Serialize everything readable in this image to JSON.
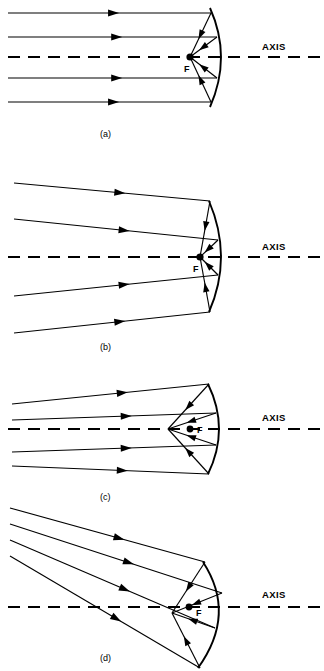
{
  "figure": {
    "panels": [
      {
        "id": "a",
        "caption": "(a)",
        "caption_x": 100,
        "caption_y": 137,
        "axis_label": "AXIS",
        "axis_label_x": 262,
        "axis_label_y": 50,
        "axis_y": 57,
        "axis_x_start": 8,
        "axis_x_end": 324,
        "focus_label": "F",
        "focus_label_x": 184,
        "focus_label_y": 72,
        "focus_x": 190,
        "focus_y": 57,
        "focus_r": 3.6,
        "vertex_x": 190,
        "vertex_y": 57,
        "arc": "M 210 8 Q 232 57 210 107",
        "rays": [
          {
            "d": "M 8 13 L 211 13",
            "arrow_at": 0.52
          },
          {
            "d": "M 8 37 L 217 37",
            "arrow_at": 0.52
          },
          {
            "d": "M 8 78 L 217 78",
            "arrow_at": 0.52
          },
          {
            "d": "M 8 102 L 211 102",
            "arrow_at": 0.52
          }
        ],
        "reflected": [
          {
            "d": "M 211 13 L 190 57",
            "arrow_at": 0.5
          },
          {
            "d": "M 217 37 L 190 57",
            "arrow_at": 0.52
          },
          {
            "d": "M 217 78 L 190 57",
            "arrow_at": 0.52
          },
          {
            "d": "M 211 102 L 190 57",
            "arrow_at": 0.5
          }
        ]
      },
      {
        "id": "b",
        "caption": "(b)",
        "caption_x": 100,
        "caption_y": 350,
        "axis_label": "AXIS",
        "axis_label_x": 262,
        "axis_label_y": 250,
        "axis_y": 257,
        "axis_x_start": 8,
        "axis_x_end": 324,
        "focus_label": "F",
        "focus_label_x": 193,
        "focus_label_y": 272,
        "focus_x": 200,
        "focus_y": 257,
        "focus_r": 3.6,
        "vertex_x": 200,
        "vertex_y": 257,
        "arc": "M 209 201 Q 233 257 209 312",
        "rays": [
          {
            "d": "M 14 183 L 210 201",
            "arrow_at": 0.54
          },
          {
            "d": "M 14 219 L 218 240",
            "arrow_at": 0.54
          },
          {
            "d": "M 14 296 L 218 275",
            "arrow_at": 0.54
          },
          {
            "d": "M 14 333 L 210 312",
            "arrow_at": 0.54
          }
        ],
        "reflected": [
          {
            "d": "M 210 201 L 200 257",
            "arrow_at": 0.45
          },
          {
            "d": "M 218 240 L 200 257",
            "arrow_at": 0.55
          },
          {
            "d": "M 218 275 L 200 257",
            "arrow_at": 0.55
          },
          {
            "d": "M 210 312 L 200 257",
            "arrow_at": 0.45
          }
        ]
      },
      {
        "id": "c",
        "caption": "(c)",
        "caption_x": 100,
        "caption_y": 500,
        "axis_label": "AXIS",
        "axis_label_x": 262,
        "axis_label_y": 421,
        "axis_y": 429,
        "axis_x_start": 8,
        "axis_x_end": 324,
        "focus_label": "F",
        "focus_label_x": 197,
        "focus_label_y": 433,
        "focus_x": 190,
        "focus_y": 429,
        "focus_r": 3.4,
        "vertex_x": 168,
        "vertex_y": 429,
        "arc": "M 208 384 Q 230 429 208 474",
        "rays": [
          {
            "d": "M 12 404 L 209 384",
            "arrow_at": 0.56
          },
          {
            "d": "M 12 420 L 216 413",
            "arrow_at": 0.56
          },
          {
            "d": "M 12 452 L 216 445",
            "arrow_at": 0.56
          },
          {
            "d": "M 12 466 L 209 474",
            "arrow_at": 0.56
          }
        ],
        "reflected": [
          {
            "d": "M 209 384 L 168 429",
            "arrow_at": 0.5
          },
          {
            "d": "M 216 413 L 168 429",
            "arrow_at": 0.52
          },
          {
            "d": "M 216 445 L 168 429",
            "arrow_at": 0.52
          },
          {
            "d": "M 209 474 L 168 429",
            "arrow_at": 0.5
          }
        ]
      },
      {
        "id": "d",
        "caption": "(d)",
        "caption_x": 100,
        "caption_y": 661,
        "axis_label": "AXIS",
        "axis_label_x": 262,
        "axis_label_y": 598,
        "axis_y": 607,
        "axis_x_start": 8,
        "axis_x_end": 324,
        "focus_label": "F",
        "focus_label_x": 196,
        "focus_label_y": 616,
        "focus_x": 189,
        "focus_y": 607,
        "focus_r": 3.4,
        "vertex_x": 172,
        "vertex_y": 613,
        "arc": "M 203 562 Q 237 614 198 668",
        "rays": [
          {
            "d": "M 10 508 L 205 562",
            "arrow_at": 0.56
          },
          {
            "d": "M 10 524 L 222 593",
            "arrow_at": 0.56
          },
          {
            "d": "M 10 540 L 215 628",
            "arrow_at": 0.56
          },
          {
            "d": "M 10 556 L 200 668",
            "arrow_at": 0.56
          }
        ],
        "reflected": [
          {
            "d": "M 205 562 L 172 613",
            "arrow_at": 0.5
          },
          {
            "d": "M 222 593 L 172 613",
            "arrow_at": 0.52
          },
          {
            "d": "M 215 628 L 172 613",
            "arrow_at": 0.52
          },
          {
            "d": "M 200 668 L 172 613",
            "arrow_at": 0.5
          }
        ]
      }
    ]
  }
}
